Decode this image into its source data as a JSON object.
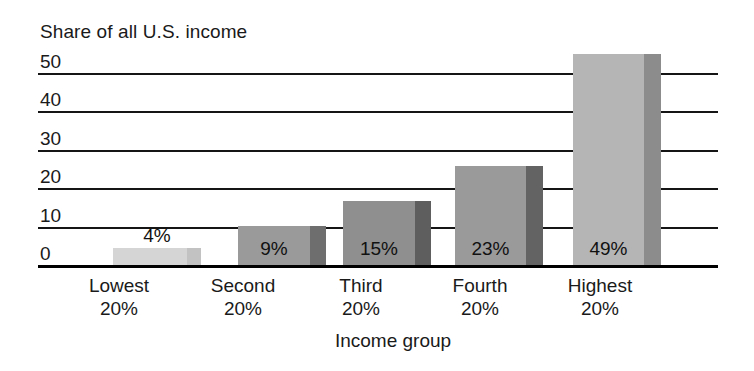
{
  "chart_data": {
    "type": "bar",
    "title": "",
    "ylabel": "Share of all U.S. income",
    "xlabel": "Income group",
    "categories": [
      "Lowest 20%",
      "Second 20%",
      "Third 20%",
      "Fourth 20%",
      "Highest 20%"
    ],
    "category_lines": [
      [
        "Lowest",
        "20%"
      ],
      [
        "Second",
        "20%"
      ],
      [
        "Third",
        "20%"
      ],
      [
        "Fourth",
        "20%"
      ],
      [
        "Highest",
        "20%"
      ]
    ],
    "values": [
      4,
      9,
      15,
      23,
      49
    ],
    "data_labels": [
      "4%",
      "9%",
      "15%",
      "23%",
      "49%"
    ],
    "ylim": [
      0,
      50
    ],
    "yticks": [
      50,
      40,
      30,
      20,
      10,
      0
    ],
    "ytick_labels": [
      "50",
      "40",
      "30",
      "20",
      "10",
      "0"
    ],
    "grid": true,
    "legend": false,
    "bar_style": {
      "face_colors": [
        "#d5d5d5",
        "#9a9a9a",
        "#8f8f8f",
        "#9a9a9a",
        "#b5b5b5"
      ],
      "side_colors": [
        "#c2c2c2",
        "#6e6e6e",
        "#5e5e5e",
        "#636363",
        "#8c8c8c"
      ],
      "axis_color": "#111111",
      "grid_color": "#151515"
    }
  }
}
